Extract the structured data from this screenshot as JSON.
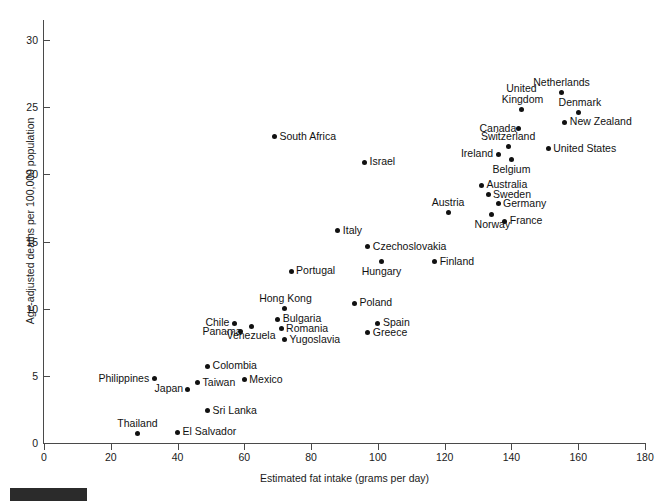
{
  "chart_data": {
    "type": "scatter",
    "title": "",
    "xlabel": "Estimated fat intake (grams per day)",
    "ylabel": "Age-adjusted deaths per 100,000 population",
    "xlim": [
      0,
      180
    ],
    "ylim": [
      0,
      31.5
    ],
    "xticks": [
      0,
      20,
      40,
      60,
      80,
      100,
      120,
      140,
      160,
      180
    ],
    "yticks": [
      0,
      5,
      10,
      15,
      20,
      25,
      30
    ],
    "grid": false,
    "legend": null,
    "point_color": "#111111",
    "axis_color": "#4a4a4a",
    "points": [
      {
        "label": "Netherlands",
        "x": 155,
        "y": 26.1,
        "label_pos": "above"
      },
      {
        "label": "Denmark",
        "x": 160,
        "y": 24.6,
        "label_pos": "above"
      },
      {
        "label": "United\nKingdom",
        "x": 143,
        "y": 24.8,
        "label_pos": "above"
      },
      {
        "label": "New Zealand",
        "x": 156,
        "y": 23.9,
        "label_pos": "right"
      },
      {
        "label": "Canada",
        "x": 142,
        "y": 23.4,
        "label_pos": "left"
      },
      {
        "label": "South Africa",
        "x": 69,
        "y": 22.8,
        "label_pos": "right"
      },
      {
        "label": "Switzerland",
        "x": 139,
        "y": 22.1,
        "label_pos": "above"
      },
      {
        "label": "Ireland",
        "x": 136,
        "y": 21.5,
        "label_pos": "left"
      },
      {
        "label": "United States",
        "x": 151,
        "y": 21.9,
        "label_pos": "right"
      },
      {
        "label": "Belgium",
        "x": 140,
        "y": 21.1,
        "label_pos": "below"
      },
      {
        "label": "Israel",
        "x": 96,
        "y": 20.9,
        "label_pos": "right"
      },
      {
        "label": "Australia",
        "x": 131,
        "y": 19.2,
        "label_pos": "right"
      },
      {
        "label": "Sweden",
        "x": 133,
        "y": 18.5,
        "label_pos": "right"
      },
      {
        "label": "Germany",
        "x": 136,
        "y": 17.8,
        "label_pos": "right"
      },
      {
        "label": "Austria",
        "x": 121,
        "y": 17.2,
        "label_pos": "above"
      },
      {
        "label": "Norway",
        "x": 134,
        "y": 17.0,
        "label_pos": "below"
      },
      {
        "label": "France",
        "x": 138,
        "y": 16.5,
        "label_pos": "right"
      },
      {
        "label": "Italy",
        "x": 88,
        "y": 15.8,
        "label_pos": "right"
      },
      {
        "label": "Czechoslovakia",
        "x": 97,
        "y": 14.6,
        "label_pos": "right"
      },
      {
        "label": "Hungary",
        "x": 101,
        "y": 13.5,
        "label_pos": "below"
      },
      {
        "label": "Finland",
        "x": 117,
        "y": 13.5,
        "label_pos": "right"
      },
      {
        "label": "Portugal",
        "x": 74,
        "y": 12.8,
        "label_pos": "right"
      },
      {
        "label": "Poland",
        "x": 93,
        "y": 10.4,
        "label_pos": "right"
      },
      {
        "label": "Hong Kong",
        "x": 72,
        "y": 10.0,
        "label_pos": "above"
      },
      {
        "label": "Bulgaria",
        "x": 70,
        "y": 9.2,
        "label_pos": "right"
      },
      {
        "label": "Chile",
        "x": 57,
        "y": 8.9,
        "label_pos": "left"
      },
      {
        "label": "Spain",
        "x": 100,
        "y": 8.9,
        "label_pos": "right"
      },
      {
        "label": "Venezuela",
        "x": 62,
        "y": 8.7,
        "label_pos": "below"
      },
      {
        "label": "Romania",
        "x": 71,
        "y": 8.5,
        "label_pos": "right"
      },
      {
        "label": "Panama",
        "x": 59,
        "y": 8.3,
        "label_pos": "left"
      },
      {
        "label": "Greece",
        "x": 97,
        "y": 8.2,
        "label_pos": "right"
      },
      {
        "label": "Yugoslavia",
        "x": 72,
        "y": 7.7,
        "label_pos": "right"
      },
      {
        "label": "Colombia",
        "x": 49,
        "y": 5.7,
        "label_pos": "right"
      },
      {
        "label": "Philippines",
        "x": 33,
        "y": 4.8,
        "label_pos": "left"
      },
      {
        "label": "Mexico",
        "x": 60,
        "y": 4.7,
        "label_pos": "right"
      },
      {
        "label": "Taiwan",
        "x": 46,
        "y": 4.5,
        "label_pos": "right"
      },
      {
        "label": "Japan",
        "x": 43,
        "y": 4.0,
        "label_pos": "left"
      },
      {
        "label": "Sri Lanka",
        "x": 49,
        "y": 2.4,
        "label_pos": "right"
      },
      {
        "label": "El Salvador",
        "x": 40,
        "y": 0.8,
        "label_pos": "right"
      },
      {
        "label": "Thailand",
        "x": 28,
        "y": 0.7,
        "label_pos": "above"
      }
    ]
  }
}
